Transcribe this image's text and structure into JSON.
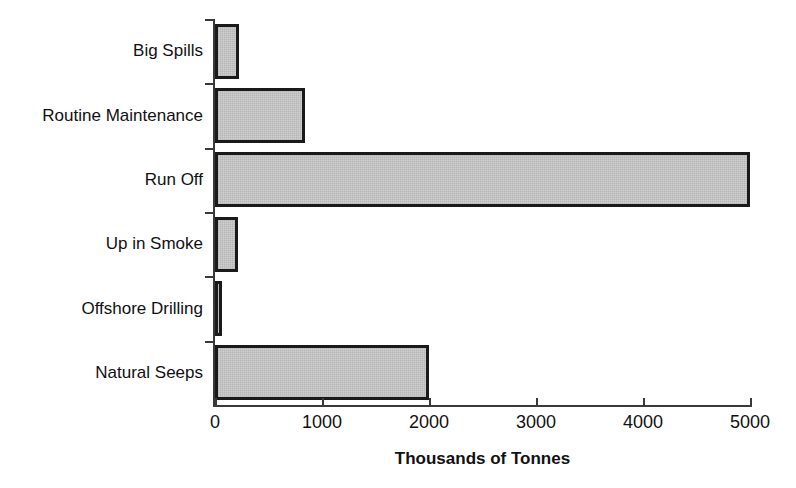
{
  "chart_data": {
    "type": "bar",
    "orientation": "horizontal",
    "title": "",
    "xlabel": "Thousands of Tonnes",
    "ylabel": "",
    "categories": [
      "Big Spills",
      "Routine Maintenance",
      "Run Off",
      "Up in Smoke",
      "Offshore Drilling",
      "Natural Seeps"
    ],
    "values": [
      220,
      840,
      5000,
      215,
      65,
      2000
    ],
    "xlim": [
      0,
      5000
    ],
    "xticks": [
      0,
      1000,
      2000,
      3000,
      4000,
      5000
    ],
    "xtick_labels": [
      "0",
      "1000",
      "2000",
      "3000",
      "4000",
      "5000"
    ],
    "grid": false,
    "legend": false,
    "bar_fill_color": "#c9c9c9",
    "bar_edge_color": "#1a1a1a",
    "axis_color": "#3a3a3a",
    "text_color": "#111111"
  }
}
